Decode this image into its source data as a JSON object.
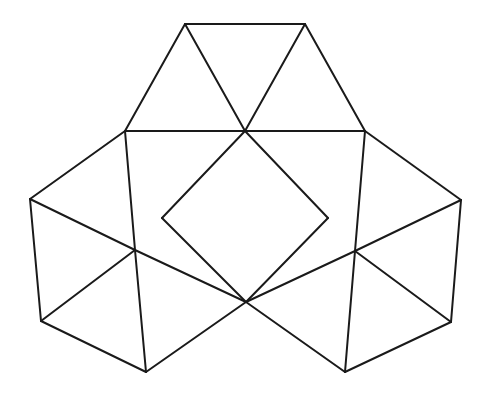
{
  "diagram": {
    "title": "",
    "stroke_color": "#1a1a1a",
    "background": "#ffffff",
    "vertices": {
      "A": [
        185,
        24
      ],
      "B": [
        305,
        24
      ],
      "C": [
        125,
        131
      ],
      "D": [
        245,
        131
      ],
      "E": [
        365,
        131
      ],
      "F": [
        30,
        199
      ],
      "G": [
        461,
        200
      ],
      "H": [
        135,
        250
      ],
      "I": [
        355,
        251
      ],
      "J": [
        162,
        218
      ],
      "K": [
        328,
        218
      ],
      "L": [
        246,
        302
      ],
      "M": [
        41,
        321
      ],
      "N": [
        451,
        322
      ],
      "O": [
        146,
        372
      ],
      "P": [
        345,
        372
      ]
    },
    "edges": [
      [
        "A",
        "B"
      ],
      [
        "A",
        "C"
      ],
      [
        "A",
        "D"
      ],
      [
        "B",
        "D"
      ],
      [
        "B",
        "E"
      ],
      [
        "C",
        "E"
      ],
      [
        "C",
        "F"
      ],
      [
        "C",
        "H"
      ],
      [
        "F",
        "H"
      ],
      [
        "F",
        "M"
      ],
      [
        "H",
        "M"
      ],
      [
        "H",
        "O"
      ],
      [
        "H",
        "L"
      ],
      [
        "M",
        "O"
      ],
      [
        "O",
        "L"
      ],
      [
        "E",
        "G"
      ],
      [
        "E",
        "I"
      ],
      [
        "G",
        "I"
      ],
      [
        "G",
        "N"
      ],
      [
        "I",
        "N"
      ],
      [
        "I",
        "P"
      ],
      [
        "I",
        "L"
      ],
      [
        "N",
        "P"
      ],
      [
        "P",
        "L"
      ],
      [
        "D",
        "J"
      ],
      [
        "J",
        "L"
      ],
      [
        "L",
        "K"
      ],
      [
        "K",
        "D"
      ]
    ]
  }
}
